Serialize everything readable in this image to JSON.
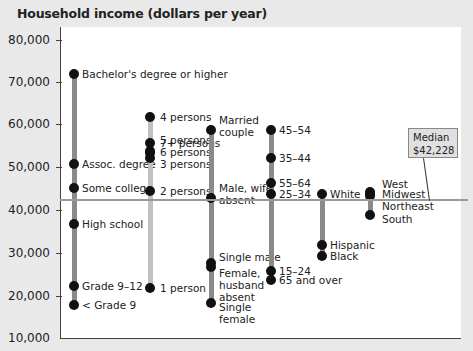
{
  "chart_data": {
    "type": "range-dot",
    "title": "Household income (dollars per year)",
    "ylabel": "Household income (dollars per year)",
    "ylim": [
      10000,
      80000
    ],
    "yticks": [
      "80,000",
      "70,000",
      "60,000",
      "50,000",
      "40,000",
      "30,000",
      "20,000",
      "10,000"
    ],
    "median": {
      "label": "Median",
      "value_label": "$42,228",
      "value": 42228
    },
    "series": [
      {
        "name": "Education",
        "points": [
          {
            "label": "Bachelor's degree or higher",
            "value": 72000
          },
          {
            "label": "Assoc. degree",
            "value": 51000
          },
          {
            "label": "Some college",
            "value": 45500
          },
          {
            "label": "High school",
            "value": 37000
          },
          {
            "label": "Grade 9–12",
            "value": 22500
          },
          {
            "label": "< Grade 9",
            "value": 18000
          }
        ]
      },
      {
        "name": "Household size",
        "points": [
          {
            "label": "4 persons",
            "value": 62000
          },
          {
            "label": "5 persons",
            "value": 56000
          },
          {
            "label": "7+ persons",
            "value": 54000
          },
          {
            "label": "6 persons",
            "value": 53500
          },
          {
            "label": "3 persons",
            "value": 52500
          },
          {
            "label": "2 persons",
            "value": 44800
          },
          {
            "label": "1 person",
            "value": 22000
          }
        ]
      },
      {
        "name": "Household type",
        "points": [
          {
            "label": "Married couple",
            "value": 59000
          },
          {
            "label": "Male, wife absent",
            "value": 43000
          },
          {
            "label": "Single male",
            "value": 28000
          },
          {
            "label": "Female, husband absent",
            "value": 27000
          },
          {
            "label": "Single female",
            "value": 18500
          }
        ]
      },
      {
        "name": "Age of householder",
        "points": [
          {
            "label": "45–54",
            "value": 59000
          },
          {
            "label": "35–44",
            "value": 52500
          },
          {
            "label": "55–64",
            "value": 46500
          },
          {
            "label": "25–34",
            "value": 44000
          },
          {
            "label": "15–24",
            "value": 26000
          },
          {
            "label": "65 and over",
            "value": 24000
          }
        ]
      },
      {
        "name": "Race",
        "points": [
          {
            "label": "White",
            "value": 44000
          },
          {
            "label": "Hispanic",
            "value": 32000
          },
          {
            "label": "Black",
            "value": 29500
          }
        ]
      },
      {
        "name": "Region",
        "points": [
          {
            "label": "West",
            "value": 44500
          },
          {
            "label": "Midwest",
            "value": 44000
          },
          {
            "label": "Northeast",
            "value": 43500
          },
          {
            "label": "South",
            "value": 39000
          }
        ]
      }
    ],
    "grid": false,
    "legend": "none"
  }
}
